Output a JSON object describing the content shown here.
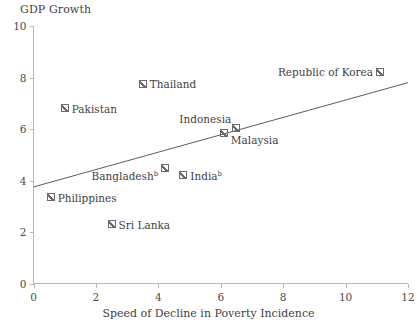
{
  "chart_data": {
    "type": "scatter",
    "title": "",
    "ylabel": "GDP Growth",
    "xlabel": "Speed of Decline in Poverty Incidence",
    "xlim": [
      0,
      12
    ],
    "ylim": [
      0,
      10
    ],
    "xticks": [
      "0",
      "2",
      "4",
      "6",
      "8",
      "10",
      "12"
    ],
    "yticks": [
      "0",
      "2",
      "4",
      "6",
      "8",
      "10"
    ],
    "grid": false,
    "legend": "none",
    "points": [
      {
        "label": "Pakistan",
        "x": 1.0,
        "y": 6.8,
        "label_pos": "right"
      },
      {
        "label": "Thailand",
        "x": 3.5,
        "y": 7.75,
        "label_pos": "right"
      },
      {
        "label": "Republic of Korea",
        "x": 11.1,
        "y": 8.2,
        "label_pos": "left"
      },
      {
        "label": "Indonesia",
        "x": 6.5,
        "y": 6.05,
        "label_pos": "above-left"
      },
      {
        "label": "Malaysia",
        "x": 6.1,
        "y": 5.85,
        "label_pos": "below-right"
      },
      {
        "label": "Bangladesh",
        "x": 4.2,
        "y": 4.5,
        "label_pos": "below-left",
        "superscript": "b"
      },
      {
        "label": "India",
        "x": 4.8,
        "y": 4.2,
        "label_pos": "right",
        "superscript": "b"
      },
      {
        "label": "Philippines",
        "x": 0.55,
        "y": 3.35,
        "label_pos": "right"
      },
      {
        "label": "Sri Lanka",
        "x": 2.5,
        "y": 2.3,
        "label_pos": "right"
      }
    ],
    "trend_line": {
      "x_start": 0,
      "y_start": 3.75,
      "x_end": 12,
      "y_end": 7.8
    },
    "colors": {
      "axis": "#b9b9b9",
      "marker": "#6b6b6b",
      "trend": "#5c5c5c",
      "text": "#3f3f3f",
      "background": "#ffffff"
    }
  }
}
